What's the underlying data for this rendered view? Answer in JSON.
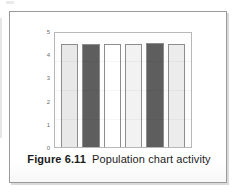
{
  "figure": {
    "caption_label": "Figure 6.11",
    "caption_text": "Population chart activity",
    "card_border_color": "#9a9a9a",
    "card_background": "#ffffff"
  },
  "chart_data": {
    "type": "bar",
    "title": "",
    "subtitle": "",
    "xlabel": "",
    "ylabel": "",
    "categories": [
      "1",
      "2",
      "3",
      "4",
      "5",
      "6"
    ],
    "values": [
      4.5,
      4.5,
      4.5,
      4.5,
      4.55,
      4.5
    ],
    "bar_colors": [
      "#e8e8e8",
      "#5e5e5e",
      "#ffffff",
      "#f2f2f2",
      "#5e5e5e",
      "#ececec"
    ],
    "bar_border_color": "#8d8d8d",
    "ylim": [
      0,
      5
    ],
    "yticks": [
      5,
      4,
      3,
      2,
      1,
      0
    ],
    "ytick_labels": [
      "5",
      "4",
      "3",
      "2",
      "1",
      "0"
    ],
    "grid": false,
    "legend": false,
    "legend_position": "none",
    "plot_frame_color": "#b7b7b7",
    "plot_background": "#fdfdfd",
    "axis_label_color": "#6d6d6d"
  }
}
